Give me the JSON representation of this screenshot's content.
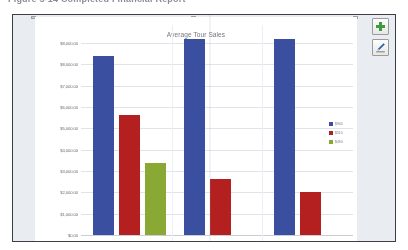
{
  "document": {
    "caption": "Figure 5-14  Completed Financial Report"
  },
  "panel": {
    "toolbar": {
      "add_label": "+",
      "add_icon": "plus-icon",
      "add_color": "#3e9b3e",
      "edit_label": "",
      "edit_icon": "pencil-icon",
      "edit_color": "#2f5fa8"
    }
  },
  "chart_data": {
    "type": "bar",
    "title": "Average Tour Sales",
    "xlabel": "",
    "ylabel": "",
    "ylim": [
      0,
      8000
    ],
    "grid": true,
    "legend_position": "right",
    "ytick_labels": [
      "$8,000.00",
      "$8,000.00",
      "$7,000.00",
      "$6,000.00",
      "$5,000.00",
      "$4,000.00",
      "$3,000.00",
      "$2,000.00",
      "$1,000.00",
      "$0.00"
    ],
    "yticks": [
      8000,
      8000,
      7000,
      6000,
      5000,
      4000,
      3000,
      2000,
      1000,
      0
    ],
    "categories": [
      "Group 1",
      "Group 2",
      "Group 3"
    ],
    "series": [
      {
        "name": "$940",
        "color": "#3a4fa0",
        "values": [
          7450,
          8150,
          8150
        ]
      },
      {
        "name": "$510",
        "color": "#b42020",
        "values": [
          5020,
          2320,
          1790
        ]
      },
      {
        "name": "$490",
        "color": "#8aa834",
        "values": [
          3020,
          0,
          0
        ]
      }
    ],
    "legend": [
      {
        "label": "$940",
        "color": "#3a4fa0"
      },
      {
        "label": "$510",
        "color": "#b42020"
      },
      {
        "label": "$490",
        "color": "#8aa834"
      }
    ]
  }
}
